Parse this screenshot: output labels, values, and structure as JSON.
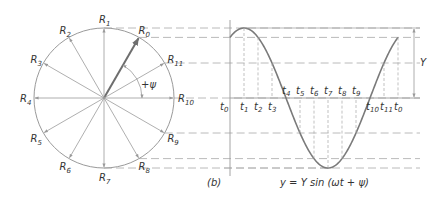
{
  "figure": {
    "label": "(b)",
    "equation": "y = Y sin (ωt + ψ)",
    "amplitude_label": "Y",
    "phase_label": "+ψ",
    "colors": {
      "line": "#9a9a9a",
      "curve": "#7a7a7a",
      "phasor_main": "#6e6e6e",
      "dashed": "#a8a8a8",
      "text": "#333333"
    }
  },
  "phasor_diagram": {
    "center": [
      104,
      98
    ],
    "radius": 70,
    "phase_angle_deg": 60,
    "phasors": [
      {
        "name": "R",
        "sub": "0",
        "angle": 60
      },
      {
        "name": "R",
        "sub": "1",
        "angle": 90
      },
      {
        "name": "R",
        "sub": "2",
        "angle": 120
      },
      {
        "name": "R",
        "sub": "3",
        "angle": 150
      },
      {
        "name": "R",
        "sub": "4",
        "angle": 180
      },
      {
        "name": "R",
        "sub": "5",
        "angle": 210
      },
      {
        "name": "R",
        "sub": "6",
        "angle": 240
      },
      {
        "name": "R",
        "sub": "7",
        "angle": 270
      },
      {
        "name": "R",
        "sub": "8",
        "angle": 300
      },
      {
        "name": "R",
        "sub": "9",
        "angle": 330
      },
      {
        "name": "R",
        "sub": "10",
        "angle": 0
      },
      {
        "name": "R",
        "sub": "11",
        "angle": 30
      }
    ]
  },
  "waveform": {
    "x_start": 230,
    "x_end": 398,
    "axis_y": 98,
    "amplitude_px": 70,
    "time_labels": [
      {
        "name": "t",
        "sub": "0"
      },
      {
        "name": "t",
        "sub": "1"
      },
      {
        "name": "t",
        "sub": "2"
      },
      {
        "name": "t",
        "sub": "3"
      },
      {
        "name": "t",
        "sub": "4"
      },
      {
        "name": "t",
        "sub": "5"
      },
      {
        "name": "t",
        "sub": "6"
      },
      {
        "name": "t",
        "sub": "7"
      },
      {
        "name": "t",
        "sub": "8"
      },
      {
        "name": "t",
        "sub": "9"
      },
      {
        "name": "t",
        "sub": "10"
      },
      {
        "name": "t",
        "sub": "11"
      },
      {
        "name": "t",
        "sub": "0"
      }
    ]
  }
}
